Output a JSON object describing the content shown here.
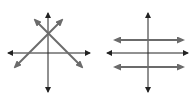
{
  "diagrams": [
    {
      "name": "intersecting-lines",
      "description": "Two lines intersecting at a single point on the y-axis",
      "axes": {
        "x_axis": [
          8,
          53,
          90,
          53
        ],
        "y_axis": [
          48,
          13,
          48,
          92
        ]
      },
      "lines": [
        {
          "from": [
            15,
            67
          ],
          "to": [
            62,
            20
          ]
        },
        {
          "from": [
            35,
            20
          ],
          "to": [
            82,
            67
          ]
        }
      ],
      "intersection": [
        48,
        33
      ]
    },
    {
      "name": "parallel-lines",
      "description": "Two horizontal parallel lines",
      "axes": {
        "x_axis": [
          107,
          53,
          188,
          53
        ],
        "y_axis": [
          148,
          13,
          148,
          92
        ]
      },
      "lines": [
        {
          "from": [
            115,
            40
          ],
          "to": [
            183,
            40
          ]
        },
        {
          "from": [
            115,
            67
          ],
          "to": [
            183,
            67
          ]
        }
      ]
    }
  ],
  "colors": {
    "axis": "#222222",
    "line": "#6b6b6b"
  }
}
